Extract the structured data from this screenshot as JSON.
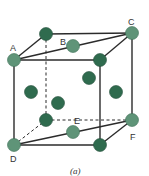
{
  "figure": {
    "caption": "(a)",
    "colors": {
      "edge": "#2b2b2b",
      "corner_atom": "#5f9478",
      "corner_atom_stroke": "#3d6e55",
      "face_atom": "#2f6b4e",
      "face_atom_stroke": "#244f3a",
      "label": "#333333"
    },
    "labels": {
      "A": "A",
      "B": "B",
      "C": "C",
      "D": "D",
      "E": "E",
      "F": "F"
    }
  }
}
